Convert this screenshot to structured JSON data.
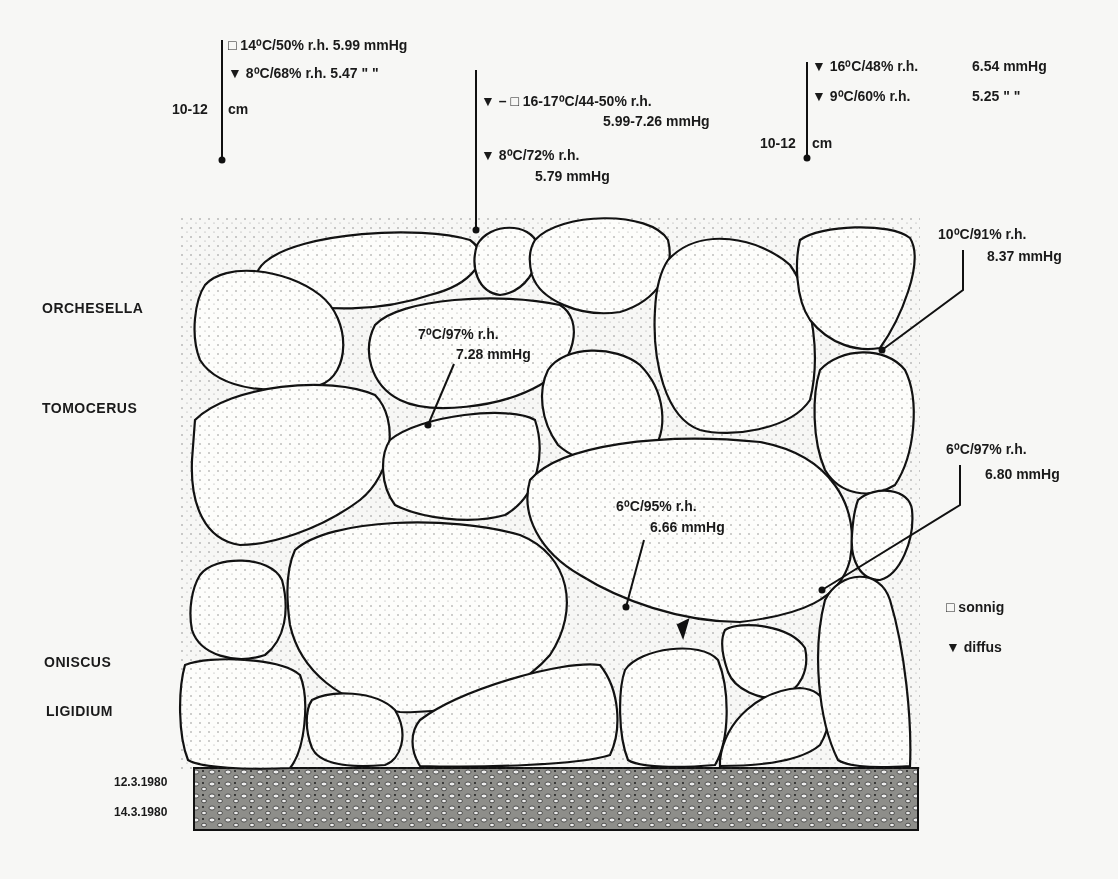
{
  "species_labels": {
    "orchesella": "ORCHESELLA",
    "tomocerus": "TOMOCERUS",
    "oniscus": "ONISCUS",
    "ligidium": "LIGIDIUM"
  },
  "dates": {
    "date1": "12.3.1980",
    "date2": "14.3.1980"
  },
  "legend": {
    "sunny_symbol": "□",
    "sunny_label": "sonnig",
    "diffuse_symbol": "▼",
    "diffuse_label": "diffus"
  },
  "annotations": {
    "left_top": {
      "line1": "□ 14⁰C/50% r.h. 5.99 mmHg",
      "line2": "▼ 8⁰C/68% r.h.  5.47  \"  \"",
      "depth": "10-12",
      "unit": "cm"
    },
    "center_top": {
      "line1": "▼ – □ 16-17⁰C/44-50% r.h.",
      "line2": "5.99-7.26 mmHg",
      "line3": "▼ 8⁰C/72% r.h.",
      "line4": "5.79 mmHg"
    },
    "right_top": {
      "line1": "▼ 16⁰C/48% r.h.",
      "line1_val": "6.54 mmHg",
      "line2": "▼ 9⁰C/60% r.h.",
      "line2_val": "5.25  \"  \"",
      "depth": "10-12",
      "unit": "cm"
    },
    "stone_upper_center": {
      "line1": "7⁰C/97% r.h.",
      "line2": "7.28 mmHg"
    },
    "stone_large_center": {
      "line1": "6⁰C/95% r.h.",
      "line2": "6.66 mmHg"
    },
    "right_upper": {
      "line1": "10⁰C/91% r.h.",
      "line2": "8.37 mmHg"
    },
    "right_middle": {
      "line1": "6⁰C/97% r.h.",
      "line2": "6.80 mmHg"
    }
  },
  "colors": {
    "ink": "#111111",
    "paper": "#f7f7f5",
    "substrate": "#8a8a86"
  }
}
